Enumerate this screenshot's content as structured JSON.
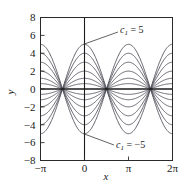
{
  "figure": {
    "background": "#ffffff",
    "curve_color": "#4a4a55",
    "axis_color": "#1a1a1a",
    "frame_color": "#2a2a2a"
  },
  "axes": {
    "x_title": "x",
    "y_title": "y",
    "x_tick_labels": [
      "−π",
      "0",
      "π",
      "2π"
    ],
    "x_tick_values": [
      -3.14159,
      0,
      3.14159,
      6.28319
    ],
    "y_tick_labels": [
      "8",
      "6",
      "4",
      "2",
      "0",
      "−2",
      "−4",
      "−6",
      "−8"
    ],
    "y_tick_values": [
      8,
      6,
      4,
      2,
      0,
      -2,
      -4,
      -6,
      -8
    ],
    "xlim": [
      -3.14159,
      6.28319
    ],
    "ylim": [
      -8,
      8
    ],
    "grid": false
  },
  "annotations": [
    {
      "name": "upper-label",
      "symbol": "c",
      "subscript": "1",
      "operator": " = ",
      "value": "5",
      "text": "c₁ = 5",
      "point_x": 0,
      "point_y": 5
    },
    {
      "name": "lower-label",
      "symbol": "c",
      "subscript": "1",
      "operator": " = ",
      "value": "−5",
      "text": "c₁ = −5",
      "point_x": 0,
      "point_y": -5
    }
  ],
  "chart_data": {
    "type": "line",
    "title": "",
    "xlabel": "x",
    "ylabel": "y",
    "xlim": [
      -3.14159,
      6.28319
    ],
    "ylim": [
      -8,
      8
    ],
    "grid": false,
    "legend": "none",
    "formula": "y = c1 * cos(x)",
    "parameter_name": "c1",
    "parameter_values": [
      -5,
      -4,
      -3,
      -2,
      -1.2,
      -0.6,
      0,
      0.6,
      1.2,
      2,
      3,
      4,
      5
    ],
    "nodes_x": [
      -1.5708,
      1.5708,
      4.71239
    ],
    "antinodes_x": [
      -3.14159,
      0,
      3.14159,
      6.28319
    ],
    "max_amplitude": 5,
    "series": [
      {
        "name": "c1 = 5",
        "c1": 5,
        "peak_at_x0": 5
      },
      {
        "name": "c1 = 4",
        "c1": 4,
        "peak_at_x0": 4
      },
      {
        "name": "c1 = 3",
        "c1": 3,
        "peak_at_x0": 3
      },
      {
        "name": "c1 = 2",
        "c1": 2,
        "peak_at_x0": 2
      },
      {
        "name": "c1 = 1.2",
        "c1": 1.2,
        "peak_at_x0": 1.2
      },
      {
        "name": "c1 = 0.6",
        "c1": 0.6,
        "peak_at_x0": 0.6
      },
      {
        "name": "c1 = 0",
        "c1": 0,
        "peak_at_x0": 0
      },
      {
        "name": "c1 = -0.6",
        "c1": -0.6,
        "peak_at_x0": -0.6
      },
      {
        "name": "c1 = -1.2",
        "c1": -1.2,
        "peak_at_x0": -1.2
      },
      {
        "name": "c1 = -2",
        "c1": -2,
        "peak_at_x0": -2
      },
      {
        "name": "c1 = -3",
        "c1": -3,
        "peak_at_x0": -3
      },
      {
        "name": "c1 = -4",
        "c1": -4,
        "peak_at_x0": -4
      },
      {
        "name": "c1 = -5",
        "c1": -5,
        "peak_at_x0": -5
      }
    ]
  }
}
